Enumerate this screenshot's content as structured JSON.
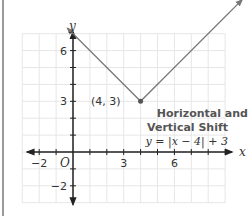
{
  "diagram": {
    "caption_line1": "Horizontal and",
    "caption_line2": "Vertical Shift",
    "equation": "y = |x − 4| + 3",
    "vertex_label": "(4, 3)",
    "axis_x_label": "x",
    "axis_y_label": "y",
    "origin_label": "O",
    "x_ticks": [
      {
        "value": -2,
        "label": "−2"
      },
      {
        "value": 3,
        "label": "3"
      },
      {
        "value": 6,
        "label": "6"
      }
    ],
    "y_ticks": [
      {
        "value": 6,
        "label": "6"
      },
      {
        "value": 3,
        "label": "3"
      },
      {
        "value": -2,
        "label": "−2"
      }
    ],
    "function": {
      "vertex": [
        4,
        3
      ],
      "x_range": [
        -0.5,
        10
      ],
      "expression": "|x - 4| + 3"
    },
    "colors": {
      "line": "#777777",
      "axis": "#222222",
      "grid": "#e6e6e6",
      "caption": "#555555"
    }
  }
}
